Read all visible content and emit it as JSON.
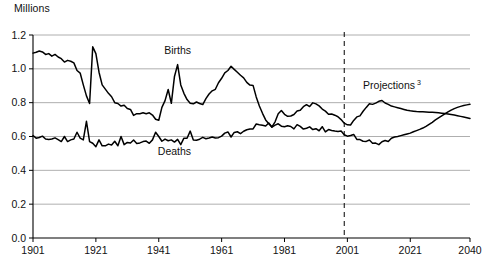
{
  "chart_data": {
    "type": "line",
    "title": "",
    "ylabel": "Millions",
    "xlabel": "",
    "ylim": [
      0.0,
      1.2
    ],
    "xlim": [
      1901,
      2040
    ],
    "grid": true,
    "gridlines_y": [
      0.2,
      0.4,
      0.6,
      0.8,
      1.0,
      1.2
    ],
    "yticks": [
      "0.0",
      "0.2",
      "0.4",
      "0.6",
      "0.8",
      "1.0",
      "1.2"
    ],
    "ytick_values": [
      0.0,
      0.2,
      0.4,
      0.6,
      0.8,
      1.0,
      1.2
    ],
    "xticks": [
      "1901",
      "1921",
      "1941",
      "1961",
      "1981",
      "2001",
      "2021",
      "2040"
    ],
    "xtick_values": [
      1901,
      1921,
      1941,
      1961,
      1981,
      2001,
      2021,
      2040
    ],
    "annotations": [
      {
        "text": "Births",
        "x": 1947,
        "y": 1.09,
        "name": "births-label"
      },
      {
        "text": "Deaths",
        "x": 1946,
        "y": 0.49,
        "name": "deaths-label"
      },
      {
        "text": "Projections",
        "superscript": "3",
        "x": 2006,
        "y": 0.88,
        "name": "projections-label"
      }
    ],
    "projection_divider": {
      "x": 2000,
      "style": "dashed",
      "label": "2001"
    },
    "series": [
      {
        "name": "Births",
        "color": "#000000",
        "x": [
          1901,
          1902,
          1903,
          1904,
          1905,
          1906,
          1907,
          1908,
          1909,
          1910,
          1911,
          1912,
          1913,
          1914,
          1915,
          1916,
          1917,
          1918,
          1919,
          1920,
          1921,
          1922,
          1923,
          1924,
          1925,
          1926,
          1927,
          1928,
          1929,
          1930,
          1931,
          1932,
          1933,
          1934,
          1935,
          1936,
          1937,
          1938,
          1939,
          1940,
          1941,
          1942,
          1943,
          1944,
          1945,
          1946,
          1947,
          1948,
          1949,
          1950,
          1951,
          1952,
          1953,
          1954,
          1955,
          1956,
          1957,
          1958,
          1959,
          1960,
          1961,
          1962,
          1963,
          1964,
          1965,
          1966,
          1967,
          1968,
          1969,
          1970,
          1971,
          1972,
          1973,
          1974,
          1975,
          1976,
          1977,
          1978,
          1979,
          1980,
          1981,
          1982,
          1983,
          1984,
          1985,
          1986,
          1987,
          1988,
          1989,
          1990,
          1991,
          1992,
          1993,
          1994,
          1995,
          1996,
          1997,
          1998,
          1999,
          2000,
          2001,
          2002,
          2003,
          2004,
          2005,
          2006,
          2007,
          2008,
          2009,
          2010,
          2011,
          2012,
          2013,
          2014,
          2015,
          2016,
          2017,
          2018,
          2019,
          2020,
          2021,
          2022,
          2023,
          2024,
          2025,
          2026,
          2027,
          2028,
          2029,
          2030,
          2031,
          2032,
          2033,
          2034,
          2035,
          2036,
          2037,
          2038,
          2039,
          2040
        ],
        "y": [
          1.093,
          1.098,
          1.105,
          1.1,
          1.085,
          1.09,
          1.075,
          1.085,
          1.07,
          1.06,
          1.04,
          1.05,
          1.045,
          1.035,
          0.99,
          0.975,
          0.905,
          0.84,
          0.795,
          1.13,
          1.09,
          0.98,
          0.905,
          0.88,
          0.855,
          0.835,
          0.8,
          0.795,
          0.78,
          0.785,
          0.765,
          0.76,
          0.725,
          0.735,
          0.735,
          0.74,
          0.735,
          0.74,
          0.727,
          0.702,
          0.696,
          0.772,
          0.812,
          0.878,
          0.796,
          0.955,
          1.025,
          0.905,
          0.855,
          0.818,
          0.797,
          0.793,
          0.804,
          0.795,
          0.789,
          0.824,
          0.851,
          0.87,
          0.879,
          0.918,
          0.944,
          0.976,
          0.99,
          1.015,
          0.997,
          0.98,
          0.962,
          0.947,
          0.92,
          0.904,
          0.902,
          0.834,
          0.78,
          0.737,
          0.698,
          0.675,
          0.657,
          0.687,
          0.735,
          0.754,
          0.731,
          0.719,
          0.721,
          0.73,
          0.751,
          0.755,
          0.776,
          0.788,
          0.777,
          0.799,
          0.793,
          0.781,
          0.762,
          0.75,
          0.732,
          0.733,
          0.726,
          0.717,
          0.7,
          0.679,
          0.669,
          0.668,
          0.695,
          0.716,
          0.722,
          0.749,
          0.772,
          0.794,
          0.79,
          0.797,
          0.808,
          0.813,
          0.798,
          0.79,
          0.78,
          0.775,
          0.77,
          0.765,
          0.76,
          0.755,
          0.752,
          0.75,
          0.748,
          0.747,
          0.746,
          0.745,
          0.744,
          0.743,
          0.742,
          0.74,
          0.738,
          0.736,
          0.733,
          0.73,
          0.727,
          0.723,
          0.719,
          0.715,
          0.711,
          0.707
        ]
      },
      {
        "name": "Deaths",
        "color": "#000000",
        "x": [
          1901,
          1902,
          1903,
          1904,
          1905,
          1906,
          1907,
          1908,
          1909,
          1910,
          1911,
          1912,
          1913,
          1914,
          1915,
          1916,
          1917,
          1918,
          1919,
          1920,
          1921,
          1922,
          1923,
          1924,
          1925,
          1926,
          1927,
          1928,
          1929,
          1930,
          1931,
          1932,
          1933,
          1934,
          1935,
          1936,
          1937,
          1938,
          1939,
          1940,
          1941,
          1942,
          1943,
          1944,
          1945,
          1946,
          1947,
          1948,
          1949,
          1950,
          1951,
          1952,
          1953,
          1954,
          1955,
          1956,
          1957,
          1958,
          1959,
          1960,
          1961,
          1962,
          1963,
          1964,
          1965,
          1966,
          1967,
          1968,
          1969,
          1970,
          1971,
          1972,
          1973,
          1974,
          1975,
          1976,
          1977,
          1978,
          1979,
          1980,
          1981,
          1982,
          1983,
          1984,
          1985,
          1986,
          1987,
          1988,
          1989,
          1990,
          1991,
          1992,
          1993,
          1994,
          1995,
          1996,
          1997,
          1998,
          1999,
          2000,
          2001,
          2002,
          2003,
          2004,
          2005,
          2006,
          2007,
          2008,
          2009,
          2010,
          2011,
          2012,
          2013,
          2014,
          2015,
          2016,
          2017,
          2018,
          2019,
          2020,
          2021,
          2022,
          2023,
          2024,
          2025,
          2026,
          2027,
          2028,
          2029,
          2030,
          2031,
          2032,
          2033,
          2034,
          2035,
          2036,
          2037,
          2038,
          2039,
          2040
        ],
        "y": [
          0.606,
          0.59,
          0.594,
          0.602,
          0.585,
          0.583,
          0.585,
          0.592,
          0.582,
          0.57,
          0.6,
          0.57,
          0.58,
          0.585,
          0.625,
          0.59,
          0.58,
          0.69,
          0.57,
          0.56,
          0.54,
          0.58,
          0.545,
          0.545,
          0.555,
          0.55,
          0.572,
          0.545,
          0.6,
          0.552,
          0.565,
          0.562,
          0.579,
          0.559,
          0.562,
          0.57,
          0.573,
          0.56,
          0.58,
          0.625,
          0.6,
          0.572,
          0.585,
          0.575,
          0.58,
          0.567,
          0.583,
          0.552,
          0.59,
          0.59,
          0.632,
          0.58,
          0.578,
          0.584,
          0.595,
          0.587,
          0.591,
          0.597,
          0.591,
          0.593,
          0.602,
          0.62,
          0.627,
          0.597,
          0.624,
          0.628,
          0.617,
          0.631,
          0.64,
          0.644,
          0.645,
          0.674,
          0.67,
          0.667,
          0.662,
          0.68,
          0.655,
          0.667,
          0.675,
          0.661,
          0.658,
          0.663,
          0.659,
          0.645,
          0.67,
          0.66,
          0.644,
          0.649,
          0.657,
          0.641,
          0.646,
          0.634,
          0.658,
          0.627,
          0.641,
          0.636,
          0.632,
          0.629,
          0.632,
          0.61,
          0.602,
          0.606,
          0.612,
          0.583,
          0.582,
          0.572,
          0.571,
          0.579,
          0.56,
          0.561,
          0.552,
          0.569,
          0.576,
          0.57,
          0.59,
          0.597,
          0.6,
          0.605,
          0.61,
          0.615,
          0.62,
          0.628,
          0.635,
          0.642,
          0.65,
          0.66,
          0.672,
          0.684,
          0.698,
          0.71,
          0.722,
          0.734,
          0.745,
          0.756,
          0.765,
          0.772,
          0.778,
          0.783,
          0.787,
          0.79
        ]
      }
    ]
  }
}
